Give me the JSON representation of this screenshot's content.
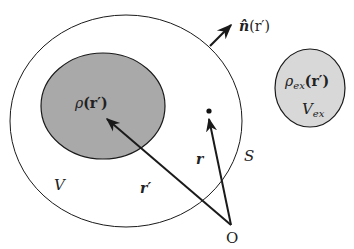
{
  "diagram": {
    "colors": {
      "background": "#ffffff",
      "stroke": "#1a1a1a",
      "charge_region_fill": "#a9a9a9",
      "external_region_fill": "#d8d8d8"
    },
    "labels": {
      "normal": "n̂(r′)",
      "normal_hat_n": "n̂",
      "normal_arg": "(r′)",
      "rho": "ρ(r′)",
      "rho_sym": "ρ",
      "rho_arg": "(r′)",
      "rho_ex_sym": "ρ",
      "rho_ex_sub": "ex",
      "rho_ex_arg": "(r′)",
      "v_ex_sym": "V",
      "v_ex_sub": "ex",
      "surface": "S",
      "volume": "V",
      "r_prime": "r′",
      "r": "r",
      "origin": "O"
    },
    "elements": {
      "outer_volume": "Volume V bounded by surface S",
      "inner_charge": "Charge distribution ρ(r′)",
      "external_charge": "External charge ρ_ex(r′) in V_ex",
      "vector_r_prime": "Position vector r′ from O to source point",
      "vector_r": "Position vector r from O to field point",
      "normal_vector": "Outward normal n̂(r′) on S"
    }
  }
}
